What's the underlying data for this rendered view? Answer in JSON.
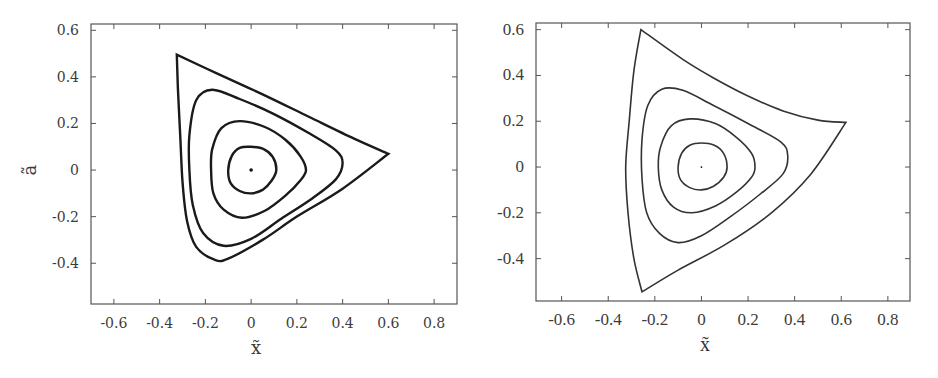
{
  "chart_data": [
    {
      "type": "line",
      "panel": "left",
      "title": "",
      "xlabel": "x̃",
      "ylabel": "ã",
      "xlim": [
        -0.7,
        0.9
      ],
      "ylim": [
        -0.575,
        0.627
      ],
      "xticks": [
        -0.6,
        -0.4,
        -0.2,
        0,
        0.2,
        0.4,
        0.6,
        0.8
      ],
      "xtick_labels": [
        "-0.6",
        "-0.4",
        "-0.2",
        "0",
        "0.2",
        "0.4",
        "0.6",
        "0.8"
      ],
      "yticks": [
        -0.4,
        -0.2,
        0,
        0.2,
        0.4,
        0.6
      ],
      "ytick_labels": [
        "-0.4",
        "-0.2",
        "0",
        "0.2",
        "0.4",
        "0.6"
      ],
      "grid": false,
      "legend": null,
      "center_point": [
        0,
        0
      ],
      "line_width": 2.4,
      "series": [
        {
          "name": "orbit-1 (innermost)",
          "closed": true,
          "points": [
            [
              0.11,
              0.0
            ],
            [
              0.095,
              0.055
            ],
            [
              0.055,
              0.09
            ],
            [
              0.0,
              0.1
            ],
            [
              -0.05,
              0.095
            ],
            [
              -0.085,
              0.06
            ],
            [
              -0.1,
              0.0
            ],
            [
              -0.09,
              -0.055
            ],
            [
              -0.05,
              -0.09
            ],
            [
              0.0,
              -0.1
            ],
            [
              0.05,
              -0.085
            ],
            [
              0.09,
              -0.045
            ]
          ]
        },
        {
          "name": "orbit-2",
          "closed": true,
          "points": [
            [
              0.24,
              0.0
            ],
            [
              0.215,
              0.06
            ],
            [
              0.15,
              0.13
            ],
            [
              0.06,
              0.185
            ],
            [
              -0.05,
              0.21
            ],
            [
              -0.13,
              0.18
            ],
            [
              -0.17,
              0.09
            ],
            [
              -0.175,
              0.0
            ],
            [
              -0.165,
              -0.1
            ],
            [
              -0.12,
              -0.17
            ],
            [
              -0.04,
              -0.205
            ],
            [
              0.06,
              -0.175
            ],
            [
              0.15,
              -0.11
            ],
            [
              0.215,
              -0.045
            ]
          ]
        },
        {
          "name": "orbit-3",
          "closed": true,
          "points": [
            [
              0.4,
              0.03
            ],
            [
              0.37,
              0.085
            ],
            [
              0.25,
              0.16
            ],
            [
              0.1,
              0.24
            ],
            [
              -0.05,
              0.305
            ],
            [
              -0.17,
              0.345
            ],
            [
              -0.24,
              0.3
            ],
            [
              -0.27,
              0.15
            ],
            [
              -0.27,
              0.0
            ],
            [
              -0.255,
              -0.15
            ],
            [
              -0.21,
              -0.27
            ],
            [
              -0.12,
              -0.325
            ],
            [
              0.0,
              -0.295
            ],
            [
              0.13,
              -0.21
            ],
            [
              0.27,
              -0.12
            ],
            [
              0.37,
              -0.04
            ]
          ]
        },
        {
          "name": "orbit-4 (separatrix)",
          "closed": true,
          "points": [
            [
              0.6,
              0.07
            ],
            [
              0.45,
              0.135
            ],
            [
              0.25,
              0.23
            ],
            [
              0.05,
              0.325
            ],
            [
              -0.15,
              0.415
            ],
            [
              -0.325,
              0.495
            ],
            [
              -0.32,
              0.35
            ],
            [
              -0.31,
              0.15
            ],
            [
              -0.3,
              -0.05
            ],
            [
              -0.28,
              -0.22
            ],
            [
              -0.24,
              -0.33
            ],
            [
              -0.16,
              -0.385
            ],
            [
              -0.1,
              -0.38
            ],
            [
              0.05,
              -0.3
            ],
            [
              0.2,
              -0.2
            ],
            [
              0.4,
              -0.08
            ],
            [
              0.6,
              0.07
            ]
          ]
        }
      ]
    },
    {
      "type": "line",
      "panel": "right",
      "title": "",
      "xlabel": "x̃",
      "ylabel": "",
      "xlim": [
        -0.71,
        0.895
      ],
      "ylim": [
        -0.585,
        0.629
      ],
      "xticks": [
        -0.6,
        -0.4,
        -0.2,
        0,
        0.2,
        0.4,
        0.6,
        0.8
      ],
      "xtick_labels": [
        "-0.6",
        "-0.4",
        "-0.2",
        "0",
        "0.2",
        "0.4",
        "0.6",
        "0.8"
      ],
      "yticks": [
        -0.4,
        -0.2,
        0,
        0.2,
        0.4,
        0.6
      ],
      "ytick_labels": [
        "-0.4",
        "-0.2",
        "0",
        "0.2",
        "0.4",
        "0.6"
      ],
      "grid": false,
      "legend": null,
      "center_point": [
        0,
        0
      ],
      "line_width": 1.6,
      "series": [
        {
          "name": "orbit-1 (innermost)",
          "closed": true,
          "points": [
            [
              0.11,
              0.0
            ],
            [
              0.095,
              0.06
            ],
            [
              0.055,
              0.095
            ],
            [
              0.0,
              0.105
            ],
            [
              -0.05,
              0.095
            ],
            [
              -0.085,
              0.06
            ],
            [
              -0.1,
              0.0
            ],
            [
              -0.09,
              -0.055
            ],
            [
              -0.05,
              -0.09
            ],
            [
              0.0,
              -0.1
            ],
            [
              0.05,
              -0.085
            ],
            [
              0.095,
              -0.045
            ]
          ]
        },
        {
          "name": "orbit-2",
          "closed": true,
          "points": [
            [
              0.23,
              0.0
            ],
            [
              0.215,
              0.06
            ],
            [
              0.15,
              0.13
            ],
            [
              0.06,
              0.19
            ],
            [
              -0.05,
              0.21
            ],
            [
              -0.13,
              0.18
            ],
            [
              -0.175,
              0.09
            ],
            [
              -0.185,
              0.0
            ],
            [
              -0.17,
              -0.1
            ],
            [
              -0.12,
              -0.175
            ],
            [
              -0.04,
              -0.2
            ],
            [
              0.06,
              -0.17
            ],
            [
              0.15,
              -0.11
            ],
            [
              0.215,
              -0.045
            ]
          ]
        },
        {
          "name": "orbit-3",
          "closed": true,
          "points": [
            [
              0.37,
              0.05
            ],
            [
              0.34,
              0.11
            ],
            [
              0.2,
              0.19
            ],
            [
              0.05,
              0.27
            ],
            [
              -0.08,
              0.335
            ],
            [
              -0.17,
              0.34
            ],
            [
              -0.23,
              0.27
            ],
            [
              -0.255,
              0.12
            ],
            [
              -0.255,
              -0.05
            ],
            [
              -0.235,
              -0.2
            ],
            [
              -0.18,
              -0.29
            ],
            [
              -0.1,
              -0.33
            ],
            [
              0.0,
              -0.3
            ],
            [
              0.12,
              -0.22
            ],
            [
              0.25,
              -0.12
            ],
            [
              0.35,
              -0.03
            ]
          ]
        },
        {
          "name": "orbit-4 (separatrix)",
          "closed": true,
          "points": [
            [
              0.62,
              0.195
            ],
            [
              0.5,
              0.205
            ],
            [
              0.35,
              0.245
            ],
            [
              0.2,
              0.31
            ],
            [
              0.05,
              0.39
            ],
            [
              -0.08,
              0.47
            ],
            [
              -0.26,
              0.6
            ],
            [
              -0.29,
              0.42
            ],
            [
              -0.31,
              0.2
            ],
            [
              -0.325,
              0.0
            ],
            [
              -0.315,
              -0.2
            ],
            [
              -0.29,
              -0.4
            ],
            [
              -0.255,
              -0.545
            ],
            [
              -0.1,
              -0.45
            ],
            [
              0.1,
              -0.34
            ],
            [
              0.3,
              -0.2
            ],
            [
              0.47,
              -0.03
            ],
            [
              0.62,
              0.195
            ]
          ]
        }
      ]
    }
  ]
}
